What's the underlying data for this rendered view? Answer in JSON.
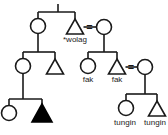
{
  "diagram": {
    "type": "kinship-chart",
    "stroke_color": "#1a1a1a",
    "fill_color": "#ffffff",
    "ego_fill_color": "#000000",
    "background_color": "#ffffff",
    "marriage_symbol": "=",
    "labels": {
      "wolag": "*wolag",
      "fak_left": "fak",
      "fak_right": "fak",
      "tungin_left": "tungin",
      "tungin_right": "tungin"
    },
    "nodes": [
      {
        "id": "g1-female-left",
        "shape": "circle",
        "sex": "female",
        "filled": false,
        "label": ""
      },
      {
        "id": "g1-male-wolag",
        "shape": "triangle",
        "sex": "male",
        "filled": false,
        "label": "*wolag"
      },
      {
        "id": "g1-female-right",
        "shape": "circle",
        "sex": "female",
        "filled": false,
        "label": ""
      },
      {
        "id": "g2-female-left",
        "shape": "circle",
        "sex": "female",
        "filled": false,
        "label": ""
      },
      {
        "id": "g2-male-left",
        "shape": "triangle",
        "sex": "male",
        "filled": false,
        "label": ""
      },
      {
        "id": "g2-female-fak",
        "shape": "circle",
        "sex": "female",
        "filled": false,
        "label": "fak"
      },
      {
        "id": "g2-male-fak",
        "shape": "triangle",
        "sex": "male",
        "filled": false,
        "label": "fak"
      },
      {
        "id": "g2-female-spouse-right",
        "shape": "circle",
        "sex": "female",
        "filled": false,
        "label": ""
      },
      {
        "id": "g3-female-left",
        "shape": "circle",
        "sex": "female",
        "filled": false,
        "label": ""
      },
      {
        "id": "g3-male-ego",
        "shape": "triangle",
        "sex": "male",
        "filled": true,
        "label": ""
      },
      {
        "id": "g3-female-tungin",
        "shape": "circle",
        "sex": "female",
        "filled": false,
        "label": "tungin"
      },
      {
        "id": "g3-male-tungin",
        "shape": "triangle",
        "sex": "male",
        "filled": false,
        "label": "tungin"
      }
    ],
    "marriages": [
      {
        "id": "marriage-wolag",
        "left": "g1-male-wolag",
        "right": "g1-female-right",
        "symbol": "="
      },
      {
        "id": "marriage-fak",
        "left": "g2-male-fak",
        "right": "g2-female-spouse-right",
        "symbol": "="
      }
    ]
  }
}
